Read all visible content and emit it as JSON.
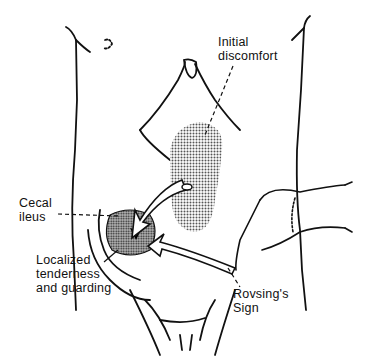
{
  "figure": {
    "type": "medical-illustration",
    "stroke_color": "#111111",
    "stipple_color": "#8a8a8a",
    "labels": {
      "initial_discomfort": [
        "Initial",
        "discomfort"
      ],
      "cecal_ileus": [
        "Cecal",
        "ileus"
      ],
      "localized_tenderness": [
        "Localized",
        "tenderness",
        "and guarding"
      ],
      "rovsings_sign": [
        "Rovsing's",
        "Sign"
      ]
    }
  }
}
